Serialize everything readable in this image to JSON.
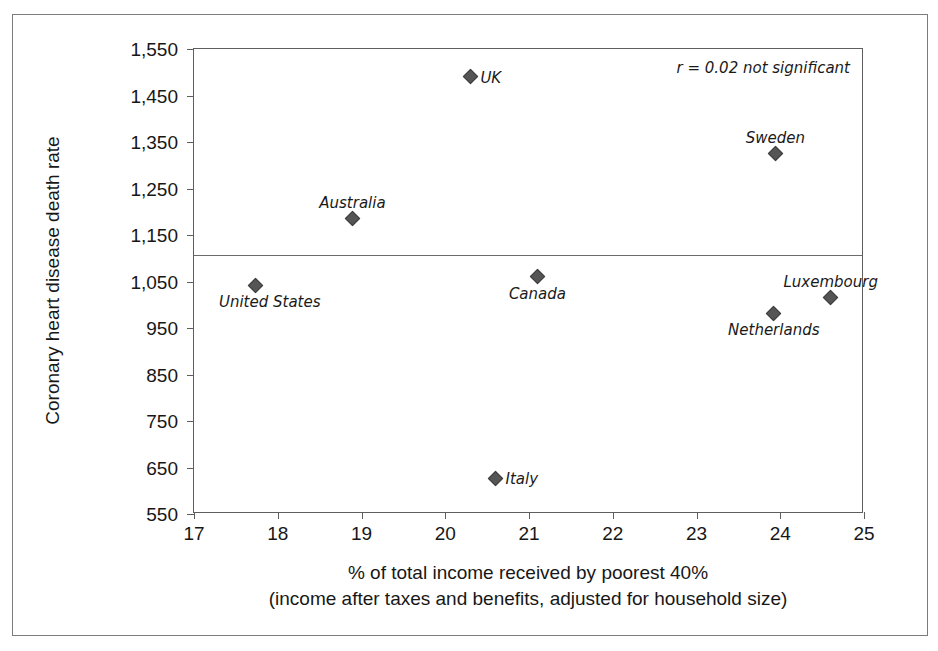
{
  "chart_data": {
    "type": "scatter",
    "title": "",
    "xlabel": "% of total income received by poorest 40%",
    "xlabel_line2": "(income after taxes and benefits, adjusted for household size)",
    "ylabel": "Coronary heart disease death rate",
    "xlim": [
      17,
      25
    ],
    "ylim": [
      550,
      1550
    ],
    "xticks": [
      "17",
      "18",
      "19",
      "20",
      "21",
      "22",
      "23",
      "24",
      "25"
    ],
    "yticks": [
      "1,550",
      "1,450",
      "1,350",
      "1,250",
      "1,150",
      "1,050",
      "950",
      "850",
      "750",
      "650",
      "550"
    ],
    "grid": false,
    "legend": "none",
    "annotation": "r = 0.02 not significant",
    "reference_line": {
      "value": 1106,
      "orientation": "horizontal"
    },
    "marker": {
      "shape": "diamond",
      "color": "#555555",
      "edge_color": "#3d3d3d"
    },
    "points": [
      {
        "label": "UK",
        "x": 20.3,
        "y": 1490,
        "label_pos": "right"
      },
      {
        "label": "Sweden",
        "x": 23.94,
        "y": 1325,
        "label_pos": "above"
      },
      {
        "label": "Australia",
        "x": 18.89,
        "y": 1185,
        "label_pos": "above"
      },
      {
        "label": "Canada",
        "x": 21.1,
        "y": 1060,
        "label_pos": "below"
      },
      {
        "label": "United States",
        "x": 17.74,
        "y": 1042,
        "label_pos": "below-right"
      },
      {
        "label": "Luxembourg",
        "x": 24.6,
        "y": 1015,
        "label_pos": "above"
      },
      {
        "label": "Netherlands",
        "x": 23.92,
        "y": 982,
        "label_pos": "below"
      },
      {
        "label": "Italy",
        "x": 20.6,
        "y": 627,
        "label_pos": "right"
      }
    ]
  }
}
